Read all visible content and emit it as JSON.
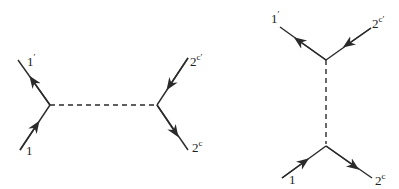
{
  "diagrams": [
    {
      "name": "horizontal-exchange",
      "labels": {
        "in_left": {
          "base": "1",
          "sup": ""
        },
        "out_left": {
          "base": "1",
          "sup": "′"
        },
        "in_right": {
          "base": "2",
          "sup": "c′"
        },
        "out_right": {
          "base": "2",
          "sup": "c"
        }
      }
    },
    {
      "name": "vertical-exchange",
      "labels": {
        "out_left": {
          "base": "1",
          "sup": "′"
        },
        "in_right": {
          "base": "2",
          "sup": "c′"
        },
        "in_left": {
          "base": "1",
          "sup": ""
        },
        "out_right": {
          "base": "2",
          "sup": "c"
        }
      }
    }
  ],
  "colors": {
    "line": "#2a2a2a",
    "background": "#ffffff"
  }
}
